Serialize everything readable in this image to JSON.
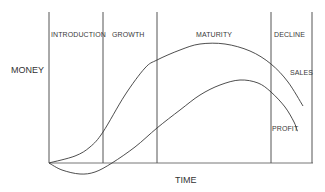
{
  "chart_data": {
    "type": "line",
    "xlabel": "TIME",
    "ylabel": "MONEY",
    "grid": false,
    "stages": [
      "INTRODUCTION",
      "GROWTH",
      "MATURITY",
      "DECLINE"
    ],
    "stage_boundaries_px": [
      49,
      103,
      157,
      271,
      312
    ],
    "series": [
      {
        "name": "SALES",
        "points_px": [
          [
            49,
            163
          ],
          [
            75,
            156
          ],
          [
            90,
            147
          ],
          [
            103,
            132
          ],
          [
            125,
            95
          ],
          [
            145,
            68
          ],
          [
            157,
            60
          ],
          [
            180,
            50
          ],
          [
            200,
            44
          ],
          [
            225,
            44
          ],
          [
            250,
            51
          ],
          [
            271,
            64
          ],
          [
            288,
            82
          ],
          [
            303,
            106
          ]
        ]
      },
      {
        "name": "PROFIT",
        "points_px": [
          [
            49,
            163
          ],
          [
            62,
            170
          ],
          [
            80,
            174
          ],
          [
            95,
            172
          ],
          [
            112,
            163
          ],
          [
            135,
            147
          ],
          [
            157,
            128
          ],
          [
            180,
            110
          ],
          [
            200,
            95
          ],
          [
            220,
            85
          ],
          [
            240,
            80
          ],
          [
            258,
            83
          ],
          [
            271,
            92
          ],
          [
            285,
            107
          ],
          [
            294,
            122
          ],
          [
            297,
            130
          ],
          [
            298,
            131
          ]
        ]
      }
    ]
  },
  "labels": {
    "y_axis": "MONEY",
    "x_axis": "TIME",
    "stage_introduction": "INTRODUCTION",
    "stage_growth": "GROWTH",
    "stage_maturity": "MATURITY",
    "stage_decline": "DECLINE",
    "series_sales": "SALES",
    "series_profit": "PROFIT"
  },
  "colors": {
    "line": "#3a3a3a",
    "divider": "#555555",
    "background": "#ffffff"
  }
}
